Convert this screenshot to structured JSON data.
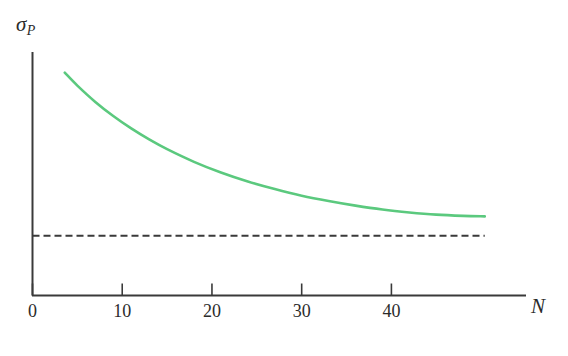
{
  "chart_data": {
    "type": "line",
    "title": "",
    "subtitle": "",
    "xlabel": "N",
    "ylabel": "σ",
    "ylabel_subscript": "P",
    "xlim": [
      0,
      55
    ],
    "ylim": [
      0,
      1
    ],
    "grid": false,
    "legend": "none",
    "xticks": [
      0,
      10,
      20,
      30,
      40
    ],
    "xtick_labels": [
      "0",
      "10",
      "20",
      "30",
      "40"
    ],
    "yticks": [],
    "ytick_labels": [],
    "series": [
      {
        "name": "total-portfolio-risk",
        "style": "solid",
        "color": "#5BC97E",
        "x": [
          3.6,
          5,
          7,
          9,
          11,
          13,
          15,
          18,
          21,
          24,
          27,
          30,
          33,
          36,
          39,
          42,
          45,
          48,
          50.4
        ],
        "y": [
          0.915,
          0.862,
          0.795,
          0.737,
          0.686,
          0.641,
          0.601,
          0.549,
          0.505,
          0.468,
          0.437,
          0.41,
          0.388,
          0.369,
          0.353,
          0.341,
          0.332,
          0.327,
          0.325
        ]
      },
      {
        "name": "systematic-risk-asymptote",
        "style": "dashed",
        "color": "#3A3A3A",
        "x": [
          0,
          50.4
        ],
        "y": [
          0.2455,
          0.2455
        ]
      }
    ],
    "annotations": []
  },
  "axes": {
    "y_axis_label_text": "σ",
    "y_axis_label_subscript": "P",
    "x_axis_label_text": "N"
  }
}
